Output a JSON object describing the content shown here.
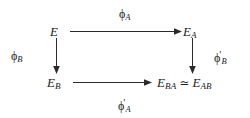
{
  "diagram": {
    "type": "commutative-square",
    "nodes": {
      "top_left": {
        "base": "E",
        "sub": "",
        "label_full": "E"
      },
      "top_right": {
        "base": "E",
        "sub": "A",
        "label_full": "E_A"
      },
      "bottom_left": {
        "base": "E",
        "sub": "B",
        "label_full": "E_B"
      },
      "bottom_right": {
        "base_left": "E",
        "sub_left": "BA",
        "relation": "≃",
        "base_right": "E",
        "sub_right": "AB",
        "label_full": "E_BA ≃ E_AB"
      }
    },
    "edges": {
      "top": {
        "symbol": "ϕ",
        "sub": "A",
        "prime": "",
        "label_full": "ϕ_A"
      },
      "left": {
        "symbol": "ϕ",
        "sub": "B",
        "prime": "",
        "label_full": "ϕ_B"
      },
      "right": {
        "symbol": "ϕ",
        "sub": "B",
        "prime": "′",
        "label_full": "ϕ'_B"
      },
      "bottom": {
        "symbol": "ϕ",
        "sub": "A",
        "prime": "′",
        "label_full": "ϕ'_A"
      }
    },
    "colors": {
      "background": "#ffffff",
      "ink": "#222222",
      "arrow": "#2b2b2b"
    }
  }
}
